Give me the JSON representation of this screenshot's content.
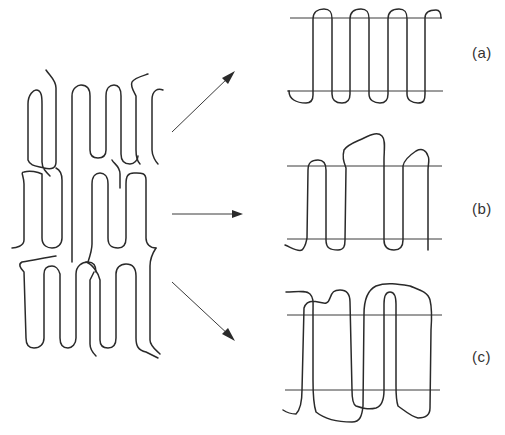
{
  "diagram": {
    "source_structure": "multilayer folded chains (lamellar stack)",
    "panels": [
      {
        "id": "a",
        "label": "(a)",
        "description": "regular adjacent re-entry folding"
      },
      {
        "id": "b",
        "label": "(b)",
        "description": "adjacent re-entry with loose loops"
      },
      {
        "id": "c",
        "label": "(c)",
        "description": "random (switchboard) re-entry"
      }
    ],
    "arrows": [
      "to-a",
      "to-b",
      "to-c"
    ],
    "colors": {
      "line": "#2a2a2a",
      "background": "#ffffff"
    }
  }
}
